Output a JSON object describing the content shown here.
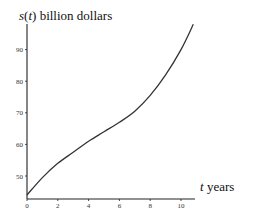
{
  "chart_data": {
    "type": "line",
    "title": "",
    "xlabel": "t years",
    "ylabel": "s(t) billion dollars",
    "ylabel_parts": {
      "func": "s",
      "var": "t",
      "rest": " billion dollars"
    },
    "xlabel_parts": {
      "var": "t",
      "rest": " years"
    },
    "x_ticks": [
      0,
      2,
      4,
      6,
      8,
      10
    ],
    "y_ticks": [
      50,
      60,
      70,
      80,
      90
    ],
    "xlim": [
      0,
      11
    ],
    "ylim": [
      43,
      100
    ],
    "grid": false,
    "series": [
      {
        "name": "s(t)",
        "x": [
          0,
          1,
          2,
          3,
          4,
          5,
          6,
          7,
          8,
          9,
          10,
          10.8
        ],
        "values": [
          44,
          49.5,
          54,
          57.5,
          61,
          64,
          67,
          70.5,
          75.5,
          82,
          90,
          98
        ]
      }
    ]
  },
  "colors": {
    "curve": "#333333",
    "axis": "#222222",
    "text": "#111111"
  }
}
